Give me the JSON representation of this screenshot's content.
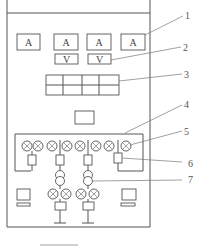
{
  "diagram": {
    "type": "control-panel-front-view",
    "ammeters": [
      {
        "label": "A"
      },
      {
        "label": "A"
      },
      {
        "label": "A"
      },
      {
        "label": "A"
      }
    ],
    "voltmeters": [
      {
        "label": "V"
      },
      {
        "label": "V"
      }
    ],
    "callouts": [
      {
        "number": "1"
      },
      {
        "number": "2"
      },
      {
        "number": "3"
      },
      {
        "number": "4"
      },
      {
        "number": "5"
      },
      {
        "number": "6"
      },
      {
        "number": "7"
      }
    ],
    "indicator_lamps_top_row": 9,
    "indicator_lamps_bottom_row": 4,
    "colors": {
      "line": "#555555",
      "background": "#ffffff"
    }
  }
}
